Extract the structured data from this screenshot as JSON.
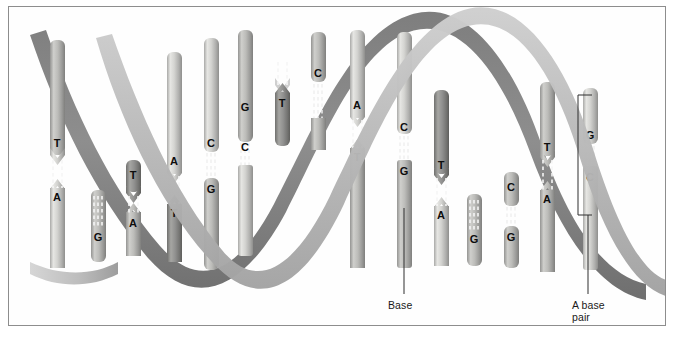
{
  "figure": {
    "background": "#ffffff",
    "frame_color": "#8d8d8d",
    "width": 676,
    "height": 338
  },
  "colors": {
    "backbone_back": "#8b8b8b",
    "backbone_front": "#b9b9b9",
    "backbone_front_light": "#d2d2d2",
    "rod_light": "#d8d8d6",
    "rod_mid": "#bdbdbb",
    "rod_dark": "#9a9a98",
    "rod_shadow": "#7d7d7b",
    "hbond": "#f4f4f4",
    "label_text": "#0d0d0d",
    "leader_line": "#3a3a3a"
  },
  "annotations": [
    {
      "id": "base",
      "label": "Base",
      "x": 388,
      "y": 299,
      "leader": {
        "x1": 404,
        "y1": 208,
        "x2": 404,
        "y2": 294
      }
    },
    {
      "id": "base-pair",
      "label": "A base\npair",
      "line1": "A base",
      "line2": "pair",
      "x": 572,
      "y": 299,
      "leader": {
        "x1": 588,
        "y1": 215,
        "x2": 588,
        "y2": 294
      },
      "bracket": {
        "x": 578,
        "y_top": 95,
        "y_bottom": 215,
        "arm": 14
      }
    }
  ],
  "helix": {
    "strands": [
      {
        "name": "strand-back",
        "shade": "dark",
        "phase": 0
      },
      {
        "name": "strand-front",
        "shade": "light",
        "phase": 180
      }
    ],
    "period_px": 152,
    "amplitude_px": 120,
    "ribbon_width_px": 17,
    "center_y": 160
  },
  "base_pairs": [
    {
      "index": 1,
      "x": 57,
      "top": "T",
      "bottom": "A",
      "type": "AT",
      "bonds": 2,
      "rod_top_y": 150,
      "rod_bot_y": 190,
      "rod_start": 40,
      "rod_end": 268
    },
    {
      "index": 2,
      "x": 98,
      "top": "",
      "bottom": "G",
      "type": "G",
      "bonds": 3,
      "rod_top_y": 228,
      "rod_bot_y": 243,
      "rod_start": 190,
      "rod_end": 262
    },
    {
      "index": 3,
      "x": 133,
      "top": "T",
      "bottom": "A",
      "type": "AT",
      "bonds": 2,
      "rod_top_y": 172,
      "rod_bot_y": 214,
      "rod_start": 160,
      "rod_end": 255
    },
    {
      "index": 4,
      "x": 174,
      "top": "A",
      "bottom": "T",
      "type": "AT",
      "bonds": 2,
      "rod_top_y": 168,
      "rod_bot_y": 206,
      "rod_start": 52,
      "rod_end": 262
    },
    {
      "index": 5,
      "x": 211,
      "top": "C",
      "bottom": "G",
      "type": "CG",
      "bonds": 3,
      "rod_top_y": 140,
      "rod_bot_y": 180,
      "rod_start": 38,
      "rod_end": 270
    },
    {
      "index": 6,
      "x": 245,
      "top": "G",
      "bottom": "C",
      "type": "CG",
      "bonds": 3,
      "rod_top_y": 104,
      "rod_bot_y": 144,
      "rod_start": 30,
      "rod_end": 256
    },
    {
      "index": 7,
      "x": 282,
      "top": "",
      "bottom": "T",
      "type": "T",
      "bonds": 2,
      "rod_top_y": 76,
      "rod_bot_y": 118,
      "rod_start": 62,
      "rod_end": 146
    },
    {
      "index": 8,
      "x": 318,
      "top": "C",
      "bottom": "",
      "type": "C",
      "bonds": 3,
      "rod_top_y": 72,
      "rod_bot_y": 112,
      "rod_start": 32,
      "rod_end": 150
    },
    {
      "index": 9,
      "x": 357,
      "top": "A",
      "bottom": "T",
      "type": "AT",
      "bonds": 2,
      "rod_top_y": 108,
      "rod_bot_y": 150,
      "rod_start": 30,
      "rod_end": 268
    },
    {
      "index": 10,
      "x": 404,
      "top": "C",
      "bottom": "G",
      "type": "CG",
      "bonds": 3,
      "rod_top_y": 126,
      "rod_bot_y": 166,
      "rod_start": 32,
      "rod_end": 268
    },
    {
      "index": 11,
      "x": 441,
      "top": "T",
      "bottom": "A",
      "type": "AT",
      "bonds": 2,
      "rod_top_y": 168,
      "rod_bot_y": 208,
      "rod_start": 90,
      "rod_end": 266
    },
    {
      "index": 12,
      "x": 474,
      "top": "",
      "bottom": "G",
      "type": "G",
      "bonds": 3,
      "rod_top_y": 230,
      "rod_bot_y": 246,
      "rod_start": 194,
      "rod_end": 270
    },
    {
      "index": 13,
      "x": 511,
      "top": "C",
      "bottom": "G",
      "type": "CG",
      "bonds": 3,
      "rod_top_y": 186,
      "rod_bot_y": 228,
      "rod_start": 172,
      "rod_end": 268
    },
    {
      "index": 14,
      "x": 547,
      "top": "T",
      "bottom": "A",
      "type": "AT",
      "bonds": 2,
      "rod_top_y": 150,
      "rod_bot_y": 192,
      "rod_start": 82,
      "rod_end": 272
    },
    {
      "index": 15,
      "x": 590,
      "top": "G",
      "bottom": "C",
      "type": "CG",
      "bonds": 3,
      "rod_top_y": 128,
      "rod_bot_y": 170,
      "rod_start": 88,
      "rod_end": 270
    }
  ],
  "nucleotide_letters": [
    "A",
    "T",
    "G",
    "C"
  ]
}
